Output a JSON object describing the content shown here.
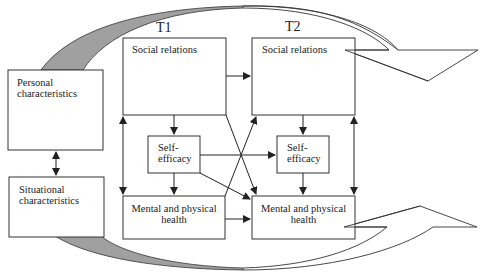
{
  "diagram": {
    "time_labels": {
      "t1": "T1",
      "t2": "T2"
    },
    "left_boxes": {
      "personal": "Personal characteristics",
      "situational": "Situational characteristics"
    },
    "t1": {
      "social": "Social relations",
      "self_efficacy_line1": "Self-",
      "self_efficacy_line2": "efficacy",
      "health_line1": "Mental and physical",
      "health_line2": "health"
    },
    "t2": {
      "social": "Social relations",
      "self_efficacy_line1": "Self-",
      "self_efficacy_line2": "efficacy",
      "health_line1": "Mental and physical",
      "health_line2": "health"
    },
    "colors": {
      "stroke": "#333333",
      "curve_fill": "#a0a0a0"
    },
    "edges": [
      {
        "from": "personal",
        "to": "situational",
        "type": "bidirectional"
      },
      {
        "from": "t1.social",
        "to": "t1.health",
        "type": "bidirectional"
      },
      {
        "from": "t1.social",
        "to": "t2.social"
      },
      {
        "from": "t1.social",
        "to": "t1.self_efficacy"
      },
      {
        "from": "t1.social",
        "to": "t2.health"
      },
      {
        "from": "t1.self_efficacy",
        "to": "t1.health"
      },
      {
        "from": "t1.self_efficacy",
        "to": "t2.self_efficacy"
      },
      {
        "from": "t1.self_efficacy",
        "to": "t2.health"
      },
      {
        "from": "t1.health",
        "to": "t2.social"
      },
      {
        "from": "t1.health",
        "to": "t2.health"
      },
      {
        "from": "t2.social",
        "to": "t2.self_efficacy"
      },
      {
        "from": "t2.social",
        "to": "t2.health",
        "type": "bidirectional"
      },
      {
        "from": "t2.self_efficacy",
        "to": "t2.health"
      },
      {
        "from": "personal",
        "to": "t2.social",
        "type": "curved-arrow"
      },
      {
        "from": "situational",
        "to": "t2.health",
        "type": "curved-arrow"
      }
    ]
  }
}
